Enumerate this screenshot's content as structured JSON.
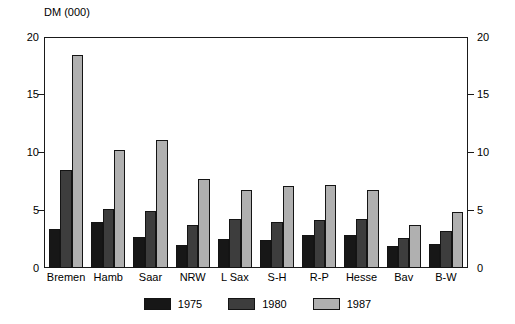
{
  "chart_data": {
    "type": "bar",
    "title": "",
    "ylabel": "DM (000)",
    "xlabel": "",
    "ylim": [
      0,
      20
    ],
    "yticks": [
      0,
      5,
      10,
      15,
      20
    ],
    "ytick_labels": [
      "0",
      "5",
      "10",
      "15",
      "20"
    ],
    "right_axis": true,
    "right_ytick_labels": [
      "0",
      "5",
      "10",
      "15",
      "20"
    ],
    "grid": false,
    "legend_position": "bottom-center",
    "categories": [
      "Bremen",
      "Hamb",
      "Saar",
      "NRW",
      "L Sax",
      "S-H",
      "R-P",
      "Hesse",
      "Bav",
      "B-W"
    ],
    "series": [
      {
        "name": "1975",
        "color": "#171717",
        "values": [
          3.4,
          4.0,
          2.7,
          2.0,
          2.5,
          2.4,
          2.9,
          2.9,
          1.9,
          2.1
        ]
      },
      {
        "name": "1980",
        "color": "#3d3d3d",
        "values": [
          8.5,
          5.1,
          5.0,
          3.7,
          4.3,
          4.0,
          4.2,
          4.3,
          2.6,
          3.2
        ]
      },
      {
        "name": "1987",
        "color": "#b0b0b0",
        "values": [
          18.5,
          10.3,
          11.1,
          7.7,
          6.8,
          7.1,
          7.2,
          6.8,
          3.7,
          4.9
        ]
      }
    ]
  },
  "legend": {
    "items": [
      {
        "label": "1975",
        "color": "#171717"
      },
      {
        "label": "1980",
        "color": "#3d3d3d"
      },
      {
        "label": "1987",
        "color": "#b0b0b0"
      }
    ]
  }
}
